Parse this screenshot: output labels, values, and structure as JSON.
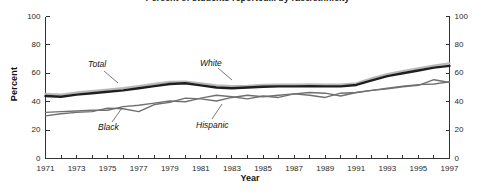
{
  "chart_data": {
    "type": "line",
    "title": "Percent of students reported... by race/ethnicity",
    "xlabel": "Year",
    "ylabel": "Percent",
    "ylim": [
      0,
      100
    ],
    "xlim": [
      1971,
      1997
    ],
    "ytick_values": [
      0,
      20,
      40,
      60,
      80,
      100
    ],
    "ytick_labels": [
      "0",
      "20",
      "40",
      "60",
      "80",
      "100"
    ],
    "right_axis": true,
    "right_ytick_labels": [
      "0",
      "20",
      "40",
      "60",
      "80",
      "100"
    ],
    "grid": false,
    "legend": "inline-labels",
    "x": [
      1971,
      1972,
      1973,
      1974,
      1975,
      1976,
      1977,
      1978,
      1979,
      1980,
      1981,
      1982,
      1983,
      1984,
      1985,
      1986,
      1987,
      1988,
      1989,
      1990,
      1991,
      1992,
      1993,
      1994,
      1995,
      1996,
      1997
    ],
    "xtick_labels": [
      "1971",
      "1973",
      "1975",
      "1977",
      "1979",
      "1981",
      "1983",
      "1985",
      "1987",
      "1989",
      "1991",
      "1993",
      "1995",
      "1997"
    ],
    "series": [
      {
        "name": "White",
        "color": "#b9b9b9",
        "width": 2.2,
        "label_x": 200,
        "label_y": 59,
        "leader": "M 218 68 L 232 80",
        "values": [
          45.5,
          45.0,
          46.5,
          47.5,
          48.5,
          49.5,
          51.0,
          52.5,
          54.0,
          54.2,
          53.0,
          51.5,
          51.0,
          51.2,
          51.8,
          52.0,
          52.0,
          52.2,
          52.0,
          52.0,
          53.0,
          56.5,
          59.5,
          61.5,
          63.5,
          65.5,
          67.0
        ]
      },
      {
        "name": "Total",
        "color": "#1f1f1f",
        "width": 2.4,
        "label_x": 88,
        "label_y": 60,
        "leader": "M 104 71 L 118 83",
        "values": [
          44.0,
          43.5,
          45.0,
          46.0,
          47.0,
          48.0,
          49.5,
          51.0,
          52.5,
          53.0,
          51.5,
          50.0,
          49.5,
          50.0,
          50.5,
          50.8,
          50.8,
          51.0,
          50.8,
          50.8,
          51.8,
          55.0,
          58.0,
          60.0,
          62.0,
          64.0,
          65.2
        ]
      },
      {
        "name": "Black",
        "color": "#6f6f6f",
        "width": 1.4,
        "label_x": 98,
        "label_y": 123,
        "leader": "M 112 122 L 122 108",
        "values": [
          30.0,
          31.5,
          32.5,
          33.0,
          35.5,
          35.0,
          33.0,
          38.0,
          39.5,
          42.5,
          42.0,
          40.5,
          43.0,
          44.5,
          43.5,
          44.5,
          45.5,
          44.5,
          43.0,
          46.0,
          46.5,
          48.0,
          49.0,
          50.5,
          51.5,
          55.5,
          53.5
        ]
      },
      {
        "name": "Hispanic",
        "color": "#707070",
        "width": 1.4,
        "label_x": 196,
        "label_y": 121,
        "leader": "M 212 119 L 222 104",
        "values": [
          32.5,
          33.0,
          33.5,
          34.0,
          34.0,
          36.5,
          37.5,
          39.0,
          40.5,
          40.0,
          42.5,
          44.5,
          43.5,
          42.0,
          44.0,
          43.0,
          45.5,
          46.5,
          46.0,
          44.0,
          46.5,
          48.0,
          49.5,
          51.0,
          52.0,
          52.5,
          54.0
        ]
      }
    ]
  }
}
